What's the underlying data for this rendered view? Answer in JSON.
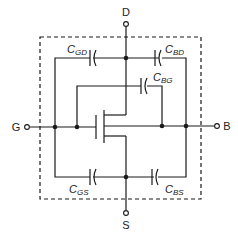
{
  "diagram": {
    "terminals": {
      "drain": "D",
      "gate": "G",
      "source": "S",
      "body": "B"
    },
    "capacitors": [
      {
        "id": "cgd",
        "base": "C",
        "sub": "GD"
      },
      {
        "id": "cbd",
        "base": "C",
        "sub": "BD"
      },
      {
        "id": "cbg",
        "base": "C",
        "sub": "BG"
      },
      {
        "id": "cgs",
        "base": "C",
        "sub": "GS"
      },
      {
        "id": "cbs",
        "base": "C",
        "sub": "BS"
      }
    ],
    "colors": {
      "line": "#1a1a1a",
      "background": "#ffffff"
    }
  }
}
